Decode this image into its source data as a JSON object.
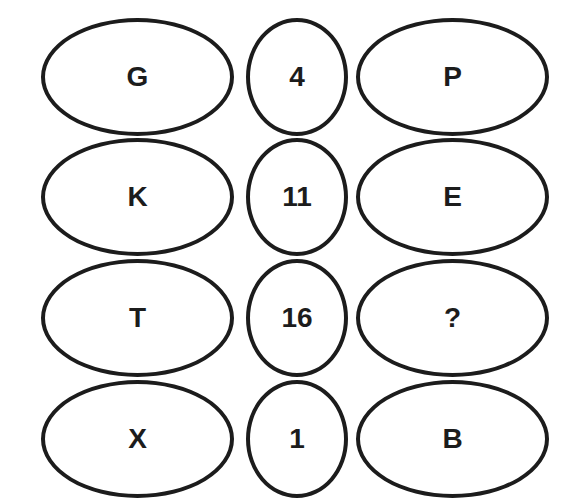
{
  "puzzle": {
    "rows": [
      {
        "left": "G",
        "middle": "4",
        "right": "P"
      },
      {
        "left": "K",
        "middle": "11",
        "right": "E"
      },
      {
        "left": "T",
        "middle": "16",
        "right": "?"
      },
      {
        "left": "X",
        "middle": "1",
        "right": "B"
      }
    ],
    "colors": {
      "stroke": "#1c1c1c",
      "text": "#1c1c1c",
      "background": "#ffffff"
    }
  }
}
